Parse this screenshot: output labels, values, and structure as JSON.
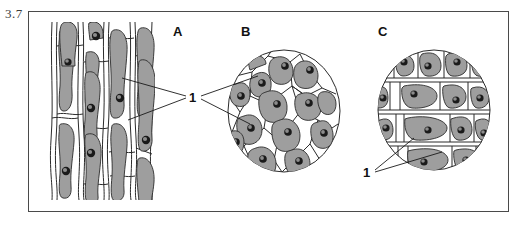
{
  "figure": {
    "number": "3.7",
    "frame": {
      "x": 28,
      "y": 11,
      "width": 481,
      "height": 201,
      "border_color": "#4a4a4a"
    }
  },
  "panels": [
    {
      "letter": "A",
      "name": "longitudinal-section-panel",
      "shape": "rectangular-field",
      "description": "Longitudinal section of elongated parenchyma cells with gray protoplasm and nuclei"
    },
    {
      "letter": "B",
      "name": "cross-section-panel",
      "shape": "circular-field",
      "description": "Circular microscope field showing polygonal cells in cross section"
    },
    {
      "letter": "C",
      "name": "longitudinal-round-field-panel",
      "shape": "circular-field",
      "description": "Circular microscope field showing rectangular cells in rows"
    }
  ],
  "callouts": [
    {
      "label": "1",
      "name": "callout-ab",
      "targets": [
        "A",
        "B"
      ]
    },
    {
      "label": "1",
      "name": "callout-c",
      "targets": [
        "C"
      ]
    }
  ],
  "colors": {
    "cell_fill": "#9e9e9e",
    "cell_fill_light": "#a8a8a8",
    "wall_stroke": "#2b2b2b",
    "nucleus": "#1a1a1a",
    "background": "#ffffff",
    "frame": "#4a4a4a",
    "figure_number": "#3c3c3c"
  }
}
